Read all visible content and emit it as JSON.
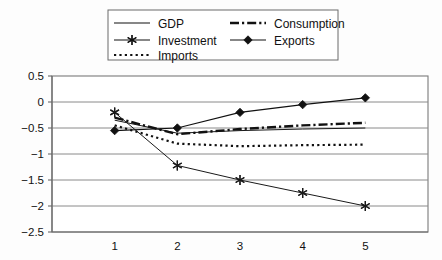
{
  "chart_data": {
    "type": "line",
    "title": "",
    "subtitle": "",
    "xlabel": "",
    "ylabel": "",
    "categories": [
      "1",
      "2",
      "3",
      "4",
      "5"
    ],
    "x": [
      1,
      2,
      3,
      4,
      5
    ],
    "ylim": [
      -2.5,
      0.5
    ],
    "xlim": [
      0.5,
      5.5
    ],
    "yticks": [
      "0.5",
      "0",
      "-0.5",
      "-1",
      "-1.5",
      "-2",
      "-2.5"
    ],
    "ytick_values": [
      0.5,
      0,
      -0.5,
      -1,
      -1.5,
      -2,
      -2.5
    ],
    "xticks": [
      "1",
      "2",
      "3",
      "4",
      "5"
    ],
    "grid": "horizontal",
    "legend_position": "top-center",
    "series": [
      {
        "name": "GDP",
        "values": [
          -0.35,
          -0.6,
          -0.55,
          -0.52,
          -0.5
        ],
        "style": "solid",
        "marker": "none",
        "color": "#1a1a1a",
        "width": 1.0
      },
      {
        "name": "Investment",
        "values": [
          -0.2,
          -1.22,
          -1.5,
          -1.75,
          -2.0
        ],
        "style": "solid",
        "marker": "asterisk",
        "color": "#1a1a1a",
        "width": 1.0
      },
      {
        "name": "Imports",
        "values": [
          -0.45,
          -0.8,
          -0.85,
          -0.83,
          -0.82
        ],
        "style": "dotted",
        "marker": "none",
        "color": "#111111",
        "width": 2.2
      },
      {
        "name": "Consumption",
        "values": [
          -0.3,
          -0.62,
          -0.52,
          -0.45,
          -0.4
        ],
        "style": "dashdot",
        "marker": "none",
        "color": "#111111",
        "width": 2.4
      },
      {
        "name": "Exports",
        "values": [
          -0.55,
          -0.5,
          -0.2,
          -0.05,
          0.08
        ],
        "style": "solid",
        "marker": "diamond",
        "color": "#111111",
        "width": 1.1
      }
    ]
  },
  "legend": {
    "entries": [
      {
        "label": "GDP",
        "style": "solid",
        "marker": "none"
      },
      {
        "label": "Consumption",
        "style": "dashdot",
        "marker": "none"
      },
      {
        "label": "Investment",
        "style": "solid",
        "marker": "asterisk"
      },
      {
        "label": "Exports",
        "style": "solid",
        "marker": "diamond"
      },
      {
        "label": "Imports",
        "style": "dotted",
        "marker": "none"
      }
    ]
  },
  "colors": {
    "background": "#fdfdfd",
    "plot_background": "#ffffff",
    "axis": "#6a6a6a",
    "grid": "#8a8a8a",
    "ink": "#111111"
  }
}
